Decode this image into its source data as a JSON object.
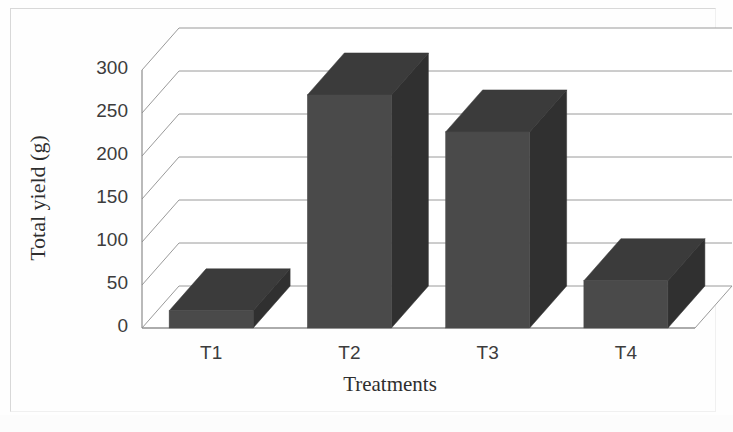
{
  "chart_data": {
    "type": "bar",
    "title": "",
    "subtitle": "",
    "xlabel": "Treatments",
    "ylabel": "Total yield (g)",
    "categories": [
      "T1",
      "T2",
      "T3",
      "T4"
    ],
    "values": [
      20,
      271,
      228,
      55
    ],
    "series": [
      {
        "name": "Total yield",
        "values": [
          20,
          271,
          228,
          55
        ]
      }
    ],
    "ylim": [
      0,
      300
    ],
    "ytick_labels": [
      "0",
      "50",
      "100",
      "150",
      "200",
      "250",
      "300"
    ],
    "ytick_values": [
      0,
      50,
      100,
      150,
      200,
      250,
      300
    ],
    "grid": true,
    "grid_axis": "y",
    "legend": false,
    "legend_position": "none",
    "style": "3d-column",
    "colors": {
      "bar_front": "#4a4a4a",
      "bar_side": "#303030",
      "bar_top": "#3b3b3b",
      "gridline": "#9a9a9a",
      "axis_line": "#8c8c8c",
      "floor": "#ffffff",
      "wall": "#ffffff",
      "text": "#3c3c3c",
      "frame": "#d8d8d8",
      "background": "#ffffff"
    }
  },
  "axis": {
    "y_title": "Total yield (g)",
    "x_title": "Treatments"
  }
}
